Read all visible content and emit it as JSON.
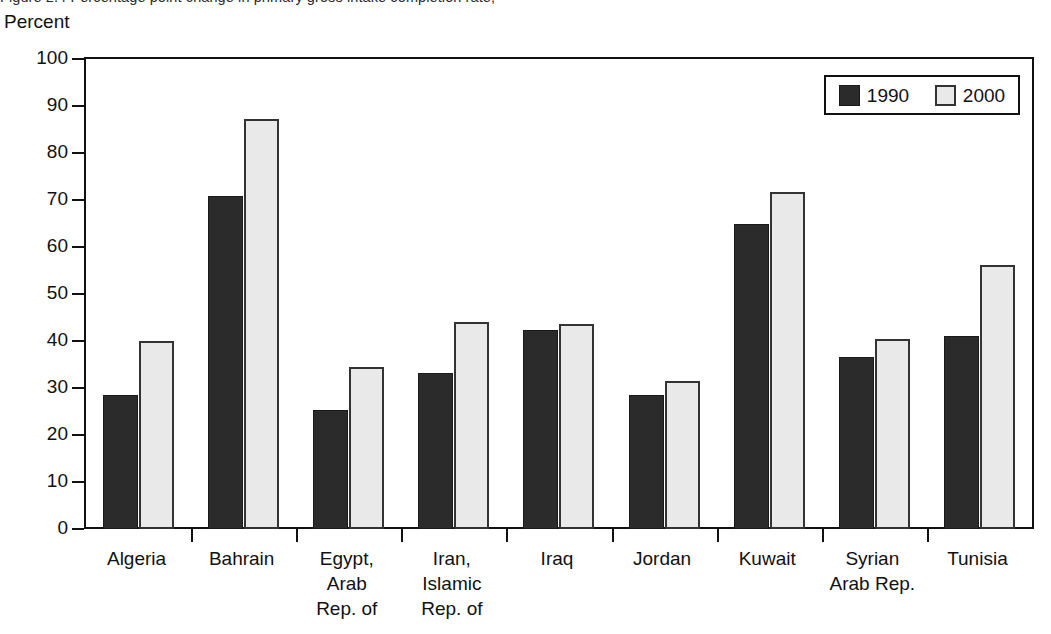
{
  "caption_sliver": "Figure 2.4  Percentage point change in primary gross intake completion rate,",
  "chart_data": {
    "type": "bar",
    "title": "",
    "subtitle": "",
    "xlabel": "",
    "ylabel": "Percent",
    "ylim": [
      0,
      100
    ],
    "ytick_step": 10,
    "yticks": [
      100,
      90,
      80,
      70,
      60,
      50,
      40,
      30,
      20,
      10,
      0
    ],
    "grid": false,
    "legend_position": "top-right",
    "categories": [
      "Algeria",
      "Bahrain",
      "Egypt, Arab Rep. of",
      "Iran, Islamic Rep. of",
      "Iraq",
      "Jordan",
      "Kuwait",
      "Syrian Arab Rep.",
      "Tunisia"
    ],
    "category_lines": [
      [
        "Algeria"
      ],
      [
        "Bahrain"
      ],
      [
        "Egypt,",
        "Arab",
        "Rep. of"
      ],
      [
        "Iran,",
        "Islamic",
        "Rep. of"
      ],
      [
        "Iraq"
      ],
      [
        "Jordan"
      ],
      [
        "Kuwait"
      ],
      [
        "Syrian",
        "Arab Rep."
      ],
      [
        "Tunisia"
      ]
    ],
    "series": [
      {
        "name": "1990",
        "color": "#2b2b2b",
        "values": [
          28.6,
          70.8,
          25.4,
          33.1,
          42.3,
          28.6,
          65.0,
          36.7,
          41.1
        ]
      },
      {
        "name": "2000",
        "color": "#e9e9e9",
        "values": [
          39.9,
          87.3,
          34.5,
          44.1,
          43.6,
          31.4,
          71.7,
          40.4,
          56.1
        ]
      }
    ]
  },
  "legend": {
    "entries": [
      {
        "label": "1990",
        "swatch": "dark-swatch-icon"
      },
      {
        "label": "2000",
        "swatch": "light-swatch-icon"
      }
    ]
  }
}
